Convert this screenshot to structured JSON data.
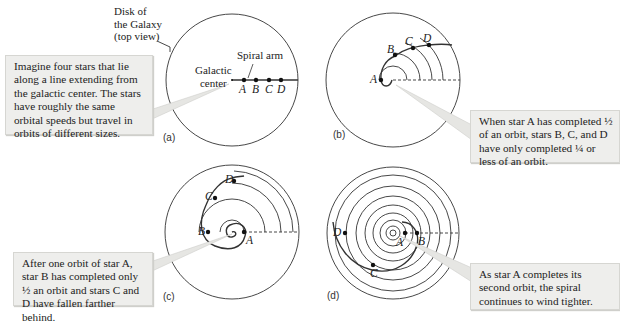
{
  "figure": {
    "disk_label": [
      "Disk of",
      "the Galaxy",
      "(top view)"
    ],
    "spiral_arm_label": "Spiral arm",
    "galactic_center_label": [
      "Galactic",
      "center"
    ],
    "stars": [
      "A",
      "B",
      "C",
      "D"
    ],
    "panels": [
      {
        "id": "a",
        "label": "(a)",
        "callout": "Imagine four stars that lie along a line extending from the galactic center. The stars have roughly the same orbital speeds but travel in orbits of different sizes."
      },
      {
        "id": "b",
        "label": "(b)",
        "callout": "When star A has completed ½ of an orbit, stars B, C, and D have only completed ¼ or less of an orbit."
      },
      {
        "id": "c",
        "label": "(c)",
        "callout": "After one orbit of star A, star B has completed only ½ an orbit and stars C and D have fallen farther behind."
      },
      {
        "id": "d",
        "label": "(d)",
        "callout": "As star A completes its second orbit, the spiral continues to wind tighter."
      }
    ]
  }
}
